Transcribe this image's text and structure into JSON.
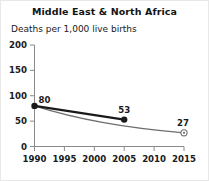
{
  "chart_data": {
    "type": "line",
    "title": "Middle East & North Africa",
    "subtitle": "Deaths per 1,000 live births",
    "xlabel": "",
    "ylabel": "Deaths per 1,000 live births",
    "xlim": [
      1990,
      2015
    ],
    "ylim": [
      0,
      200
    ],
    "xticks": [
      1990,
      1995,
      2000,
      2005,
      2010,
      2015
    ],
    "yticks": [
      0,
      50,
      100,
      150,
      200
    ],
    "xtick_labels": [
      "1990",
      "1995",
      "2000",
      "2005",
      "2010",
      "2015"
    ],
    "ytick_labels": [
      "0",
      "50",
      "100",
      "150",
      "200"
    ],
    "grid": false,
    "legend": "none",
    "series": [
      {
        "name": "observed",
        "style": "solid-thick-dark",
        "color": "#1a1a1a",
        "marker": "filled-circle",
        "x": [
          1990,
          2005
        ],
        "values": [
          80,
          53
        ],
        "labels": [
          "80",
          "53"
        ]
      },
      {
        "name": "target-path",
        "style": "solid-thin-gray",
        "color": "#6e6e6e",
        "marker": "open-circle-dot",
        "x": [
          1990,
          2015
        ],
        "values": [
          80,
          27
        ],
        "labels": [
          "",
          "27"
        ]
      }
    ],
    "annotations": [
      {
        "text": "80",
        "x": 1990,
        "y": 80
      },
      {
        "text": "53",
        "x": 2005,
        "y": 53
      },
      {
        "text": "27",
        "x": 2015,
        "y": 27
      }
    ]
  },
  "colors": {
    "observed_line": "#1a1a1a",
    "target_line": "#6e6e6e",
    "axis": "#8a8a8a",
    "text": "#1a1a1a",
    "background": "#ffffff"
  }
}
